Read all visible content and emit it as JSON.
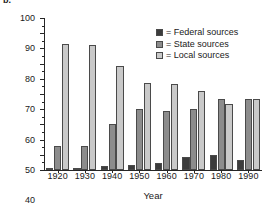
{
  "panel": {
    "label": "b."
  },
  "chart_data": {
    "type": "bar",
    "title": "",
    "subtitle": "",
    "xlabel": "Year",
    "ylabel": "Percentage",
    "categories": [
      "1920",
      "1930",
      "1940",
      "1950",
      "1960",
      "1970",
      "1980",
      "1990"
    ],
    "ylim": [
      0,
      100
    ],
    "y_ticks": [
      0,
      10,
      20,
      30,
      40,
      50,
      60,
      70,
      80,
      90,
      100
    ],
    "y_minor_tick_step": 5,
    "grid": false,
    "legend_position": "top-right",
    "series": [
      {
        "name": "Federal sources",
        "legend_label": "= Federal sources",
        "color": "#3c3c3c",
        "values": [
          0.5,
          1,
          2.5,
          3,
          4.5,
          8.5,
          10,
          6.5
        ]
      },
      {
        "name": "State sources",
        "legend_label": "= State sources",
        "color": "#8c8c8c",
        "values": [
          16,
          16,
          30.5,
          40,
          39,
          40,
          47,
          47
        ]
      },
      {
        "name": "Local sources",
        "legend_label": "= Local sources",
        "color": "#c9c9c9",
        "values": [
          83,
          82.5,
          68.5,
          57.5,
          56.5,
          52,
          43.5,
          46.5
        ]
      }
    ]
  }
}
